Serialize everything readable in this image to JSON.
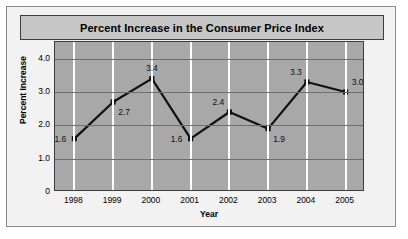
{
  "chart_data": {
    "type": "line",
    "title": "Percent Increase in the Consumer Price Index",
    "xlabel": "Year",
    "ylabel": "Percent Increase",
    "categories": [
      "1998",
      "1999",
      "2000",
      "2001",
      "2002",
      "2003",
      "2004",
      "2005"
    ],
    "values": [
      1.6,
      2.7,
      3.4,
      1.6,
      2.4,
      1.9,
      3.3,
      3.0
    ],
    "point_labels": [
      "1.6",
      "2.7",
      "3.4",
      "1.6",
      "2.4",
      "1.9",
      "3.3",
      "3.0"
    ],
    "label_positions": [
      "left",
      "below-right",
      "above",
      "left",
      "above-left",
      "below-right",
      "above-left",
      "above-right"
    ],
    "ylim": [
      0,
      4.5
    ],
    "yticks": [
      0,
      1.0,
      2.0,
      3.0,
      4.0
    ],
    "ytick_labels": [
      "0",
      "1.0",
      "2.0",
      "3.0",
      "4.0"
    ],
    "grid": "vertical-white-horizontal-dark",
    "legend": "none",
    "series_color": "#111111",
    "plot_background": "#a8a8a8",
    "panel_background": "#c6c6c6"
  }
}
